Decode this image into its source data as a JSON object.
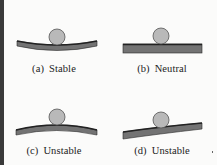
{
  "figure": {
    "panels": [
      {
        "id": "a",
        "label": "(a)",
        "caption": "Stable",
        "surface": "concave"
      },
      {
        "id": "b",
        "label": "(b)",
        "caption": "Neutral",
        "surface": "flat"
      },
      {
        "id": "c",
        "label": "(c)",
        "caption": "Unstable",
        "surface": "convex"
      },
      {
        "id": "d",
        "label": "(d)",
        "caption": "Unstable",
        "surface": "inclined-convex"
      }
    ],
    "colors": {
      "ball_fill": "#b9b9b9",
      "ball_stroke": "#555555",
      "surface_fill": "#737373",
      "surface_top": "#2a2a2a",
      "background": "#fbfbfa"
    }
  }
}
